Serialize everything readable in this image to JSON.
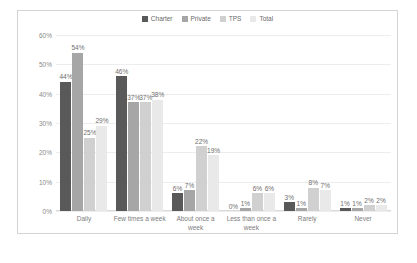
{
  "chart_data": {
    "type": "bar",
    "title": "",
    "xlabel": "",
    "ylabel": "",
    "ylim": [
      0,
      60
    ],
    "yticks": [
      "0%",
      "10%",
      "20%",
      "30%",
      "40%",
      "50%",
      "60%"
    ],
    "grid": true,
    "legend_position": "top-center",
    "categories": [
      "Daily",
      "Few times a week",
      "About once a week",
      "Less than once a week",
      "Rarely",
      "Never"
    ],
    "series": [
      {
        "name": "Charter",
        "color": "#595959",
        "values": [
          44,
          46,
          6,
          0,
          3,
          1
        ],
        "labels": [
          "44%",
          "46%",
          "6%",
          "0%",
          "3%",
          "1%"
        ]
      },
      {
        "name": "Private",
        "color": "#a6a6a6",
        "values": [
          54,
          37,
          7,
          1,
          1,
          1
        ],
        "labels": [
          "54%",
          "37%",
          "7%",
          "1%",
          "1%",
          "1%"
        ]
      },
      {
        "name": "TPS",
        "color": "#d0d0d0",
        "values": [
          25,
          37,
          22,
          6,
          8,
          2
        ],
        "labels": [
          "25%",
          "37%",
          "22%",
          "6%",
          "8%",
          "2%"
        ]
      },
      {
        "name": "Total",
        "color": "#e9e9e9",
        "values": [
          29,
          38,
          19,
          6,
          7,
          2
        ],
        "labels": [
          "29%",
          "38%",
          "19%",
          "6%",
          "7%",
          "2%"
        ]
      }
    ]
  }
}
